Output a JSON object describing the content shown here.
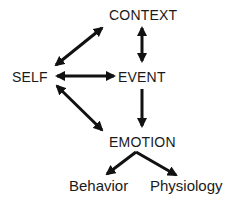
{
  "diagram": {
    "nodes": {
      "context": {
        "label": "CONTEXT"
      },
      "self": {
        "label": "SELF"
      },
      "event": {
        "label": "EVENT"
      },
      "emotion": {
        "label": "EMOTION"
      },
      "behavior": {
        "label": "Behavior"
      },
      "physiology": {
        "label": "Physiology"
      }
    },
    "edges": [
      {
        "from": "self",
        "to": "context",
        "direction": "bidirectional"
      },
      {
        "from": "context",
        "to": "event",
        "direction": "bidirectional"
      },
      {
        "from": "self",
        "to": "event",
        "direction": "bidirectional"
      },
      {
        "from": "self",
        "to": "emotion",
        "direction": "bidirectional"
      },
      {
        "from": "event",
        "to": "emotion",
        "direction": "forward"
      },
      {
        "from": "emotion",
        "to": "behavior",
        "direction": "forward"
      },
      {
        "from": "emotion",
        "to": "physiology",
        "direction": "forward"
      }
    ],
    "colors": {
      "ink": "#1a1a1a",
      "background": "#ffffff"
    }
  }
}
